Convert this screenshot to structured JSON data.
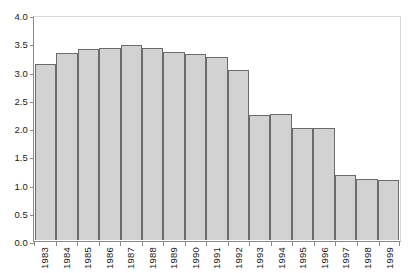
{
  "chart_data": {
    "type": "bar",
    "title": "",
    "subtitle": "",
    "xlabel": "",
    "ylabel": "",
    "ylim": [
      0.0,
      4.0
    ],
    "ytick_labels": [
      "4.0",
      "3.5",
      "3.0",
      "2.5",
      "2.0",
      "1.5",
      "1.0",
      "0.5",
      "0.0"
    ],
    "ytick_values": [
      4.0,
      3.5,
      3.0,
      2.5,
      2.0,
      1.5,
      1.0,
      0.5,
      0.0
    ],
    "grid": false,
    "legend": null,
    "legend_position": "none",
    "categories": [
      "1983",
      "1984",
      "1985",
      "1986",
      "1987",
      "1988",
      "1989",
      "1990",
      "1991",
      "1992",
      "1993",
      "1994",
      "1995",
      "1996",
      "1997",
      "1998",
      "1999"
    ],
    "values": [
      3.13,
      3.33,
      3.39,
      3.41,
      3.46,
      3.41,
      3.35,
      3.3,
      3.26,
      3.02,
      2.22,
      2.24,
      2.0,
      2.0,
      1.15,
      1.08,
      1.07
    ],
    "bar_fill_color": "#d2d2d2",
    "bar_border_color": "#6b6b6b",
    "axis_color": "#8a8a8a",
    "frame_color": "#d9d9d9",
    "background_color": "#ffffff",
    "text_color": "#1a1a1a"
  }
}
